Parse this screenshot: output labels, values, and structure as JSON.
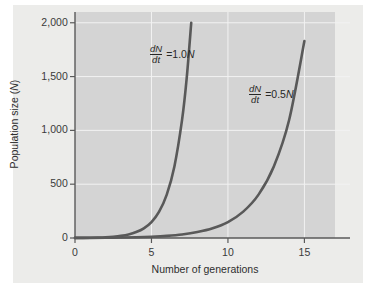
{
  "figure": {
    "background_color": "#ececea",
    "plot_background_color": "#d4d4d4",
    "gridline_color": "#f2f2f2",
    "axis_color": "#5a5a5a",
    "curve_color": "#595959"
  },
  "axes": {
    "y": {
      "label": "Population size (N)",
      "label_plain": "Population size",
      "label_italic_var": "N",
      "ticks": [
        "0",
        "500",
        "1,000",
        "1,500",
        "2,000"
      ],
      "tick_values": [
        0,
        500,
        1000,
        1500,
        2000
      ],
      "min": 0,
      "max": 2100
    },
    "x": {
      "label": "Number of generations",
      "ticks": [
        "0",
        "5",
        "10",
        "15"
      ],
      "tick_values": [
        0,
        5,
        10,
        15
      ],
      "min": 0,
      "max": 17
    }
  },
  "annotations": [
    {
      "id": "annot-1",
      "numerator": "dN",
      "denominator": "dt",
      "equals": "=",
      "rate": "1.0",
      "variable": "N",
      "text": "dN/dt = 1.0N"
    },
    {
      "id": "annot-2",
      "numerator": "dN",
      "denominator": "dt",
      "equals": "=",
      "rate": "0.5",
      "variable": "N",
      "text": "dN/dt = 0.5N"
    }
  ],
  "chart_data": {
    "type": "line",
    "title": "",
    "xlabel": "Number of generations",
    "ylabel": "Population size (N)",
    "xlim": [
      0,
      17
    ],
    "ylim": [
      0,
      2100
    ],
    "xticks": [
      0,
      5,
      10,
      15
    ],
    "yticks": [
      0,
      500,
      1000,
      1500,
      2000
    ],
    "grid": true,
    "legend": "annotations-inline",
    "series": [
      {
        "name": "dN/dt = 1.0N",
        "r": 1.0,
        "N0": 1,
        "color": "#595959",
        "x": [
          0,
          0.5,
          1,
          1.5,
          2,
          2.5,
          3,
          3.5,
          4,
          4.5,
          5,
          5.5,
          6,
          6.5,
          7,
          7.3,
          7.6
        ],
        "y": [
          1,
          1.6,
          2.7,
          4.5,
          7.4,
          12.2,
          20,
          33,
          55,
          90,
          148,
          245,
          403,
          665,
          1097,
          1480,
          2000
        ]
      },
      {
        "name": "dN/dt = 0.5N",
        "r": 0.5,
        "N0": 1,
        "color": "#595959",
        "x": [
          0,
          1,
          2,
          3,
          4,
          5,
          6,
          7,
          8,
          9,
          10,
          11,
          12,
          13,
          14,
          15
        ],
        "y": [
          1,
          1.6,
          2.7,
          4.5,
          7.4,
          12.2,
          20,
          33,
          55,
          90,
          148,
          245,
          403,
          665,
          1097,
          1830
        ]
      }
    ]
  }
}
